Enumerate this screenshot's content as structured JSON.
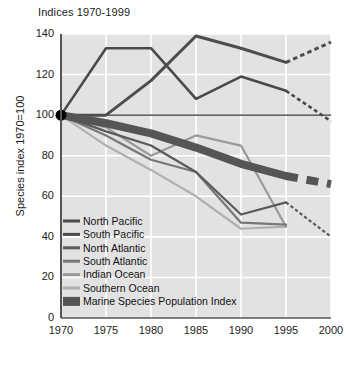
{
  "figure": {
    "title": "Indices 1970-1999",
    "ylabel": "Species index 1970=100",
    "xlabel": ""
  },
  "axis": {
    "yticks": [
      "0",
      "20",
      "40",
      "60",
      "80",
      "100",
      "120",
      "140"
    ],
    "xticks": [
      "1970",
      "1975",
      "1980",
      "1985",
      "1990",
      "1995",
      "2000"
    ]
  },
  "colors": {
    "plot_background": "#e2e2e2",
    "gridline": "#ffffff",
    "axis": "#555555",
    "text": "#1a1a1a",
    "north_pacific": "#4d4d4d",
    "south_pacific": "#4a4a4a",
    "north_atlantic": "#5a5a5a",
    "south_atlantic": "#777777",
    "indian_ocean": "#9a9a9a",
    "southern_ocean": "#b0b0b0",
    "marine_index": "#555555",
    "origin_marker": "#000000",
    "reference_line": "#333333"
  },
  "legend": {
    "items": [
      {
        "label": "North Pacific",
        "color": "#4d4d4d",
        "style": "line"
      },
      {
        "label": "South Pacific",
        "color": "#4a4a4a",
        "style": "line"
      },
      {
        "label": "North Atlantic",
        "color": "#5a5a5a",
        "style": "line"
      },
      {
        "label": "South Atlantic",
        "color": "#777777",
        "style": "line"
      },
      {
        "label": "Indian Ocean",
        "color": "#9a9a9a",
        "style": "line"
      },
      {
        "label": "Southern Ocean",
        "color": "#b0b0b0",
        "style": "line"
      },
      {
        "label": "Marine Species Population Index",
        "color": "#555555",
        "style": "band"
      }
    ]
  },
  "chart_data": {
    "type": "line",
    "title": "Indices 1970-1999",
    "xlabel": "",
    "ylabel": "Species index 1970=100",
    "x": [
      1970,
      1975,
      1980,
      1985,
      1990,
      1995,
      2000
    ],
    "xlim": [
      1970,
      2000
    ],
    "ylim": [
      0,
      140
    ],
    "grid": true,
    "legend_position": "inside-bottom-left",
    "reference_line": 100,
    "origin_marker": {
      "x": 1970,
      "y": 100
    },
    "series": [
      {
        "name": "North Pacific",
        "color": "#4d4d4d",
        "width": 3,
        "values": [
          100,
          100,
          117,
          139,
          133,
          126
        ],
        "x": [
          1970,
          1975,
          1980,
          1985,
          1990,
          1995
        ],
        "projection": {
          "x": [
            1995,
            2000
          ],
          "values": [
            126,
            136
          ],
          "dashed": true
        }
      },
      {
        "name": "South Pacific",
        "color": "#4a4a4a",
        "width": 2.6,
        "values": [
          100,
          133,
          133,
          108,
          119,
          112
        ],
        "x": [
          1970,
          1975,
          1980,
          1985,
          1990,
          1995
        ],
        "projection": {
          "x": [
            1995,
            2000
          ],
          "values": [
            112,
            97
          ],
          "dashed": true
        }
      },
      {
        "name": "North Atlantic",
        "color": "#5a5a5a",
        "width": 2.2,
        "values": [
          100,
          92,
          85,
          72,
          51,
          57
        ],
        "x": [
          1970,
          1975,
          1980,
          1985,
          1990,
          1995
        ],
        "projection": {
          "x": [
            1995,
            2000
          ],
          "values": [
            57,
            40
          ],
          "dashed": true
        }
      },
      {
        "name": "South Atlantic",
        "color": "#777777",
        "width": 2.2,
        "values": [
          100,
          90,
          78,
          72,
          47,
          46
        ],
        "x": [
          1970,
          1975,
          1980,
          1985,
          1990,
          1995
        ],
        "projection": null
      },
      {
        "name": "Indian Ocean",
        "color": "#9a9a9a",
        "width": 2.2,
        "values": [
          100,
          94,
          80,
          90,
          85,
          45
        ],
        "x": [
          1970,
          1975,
          1980,
          1985,
          1990,
          1995
        ],
        "projection": null
      },
      {
        "name": "Southern Ocean",
        "color": "#b0b0b0",
        "width": 2.2,
        "values": [
          100,
          85,
          73,
          60,
          44,
          45
        ],
        "x": [
          1970,
          1975,
          1980,
          1985,
          1990,
          1995
        ],
        "projection": null
      }
    ],
    "band_series": {
      "name": "Marine Species Population Index",
      "color": "#555555",
      "width": 8,
      "values": [
        100,
        96,
        91,
        84,
        76,
        70
      ],
      "x": [
        1970,
        1975,
        1980,
        1985,
        1990,
        1995
      ],
      "projection": {
        "x": [
          1995,
          2000
        ],
        "values": [
          70,
          66
        ],
        "dashed": true
      }
    }
  }
}
